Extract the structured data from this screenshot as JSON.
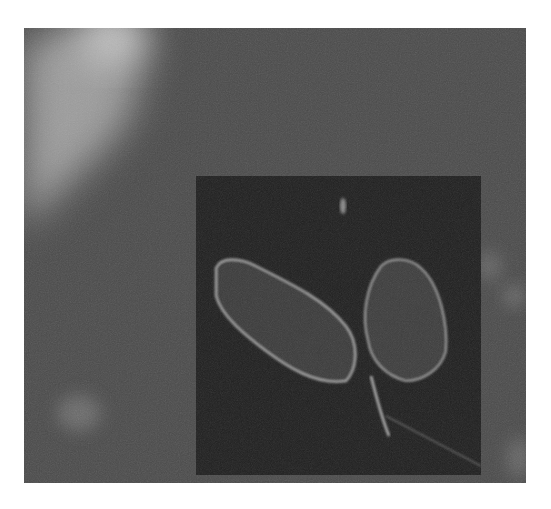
{
  "image": {
    "description": "Grayscale fluorescence microscopy image with a magnified inset showing two cells",
    "colors": {
      "page_background": "#ffffff",
      "frame_background": "#4a4a4a",
      "bright_region": "#b0b0b0",
      "inset_background": "#1f1f1f",
      "cell_fill": "#3c3c3c",
      "cell_edge": "#9a9a9a"
    }
  }
}
